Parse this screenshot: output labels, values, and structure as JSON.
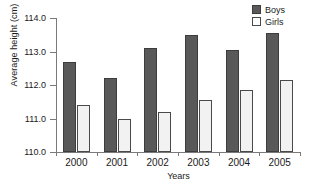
{
  "chart_data": {
    "type": "bar",
    "title": "",
    "xlabel": "Years",
    "ylabel": "Average height (cm)",
    "categories": [
      "2000",
      "2001",
      "2002",
      "2003",
      "2004",
      "2005"
    ],
    "series": [
      {
        "name": "Boys",
        "color": "#595959",
        "values": [
          112.7,
          112.2,
          113.1,
          113.5,
          113.05,
          113.55
        ]
      },
      {
        "name": "Girls",
        "color": "#f2f2f2",
        "values": [
          111.4,
          111.0,
          111.2,
          111.55,
          111.85,
          112.15
        ]
      }
    ],
    "ylim": [
      110.0,
      114.0
    ],
    "ytick_labels": [
      "110.0",
      "111.0",
      "112.0",
      "113.0",
      "114.0"
    ],
    "ytick_values": [
      110.0,
      111.0,
      112.0,
      113.0,
      114.0
    ],
    "grid": false,
    "legend_position": "top-right"
  },
  "legend": {
    "entries": [
      {
        "label": "Boys"
      },
      {
        "label": "Girls"
      }
    ]
  }
}
